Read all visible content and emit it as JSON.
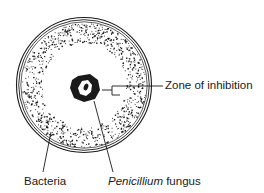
{
  "diagram": {
    "labels": {
      "zone": "Zone of inhibition",
      "bacteria": "Bacteria",
      "fungus_italic": "Penicillium",
      "fungus_rest": " fungus"
    },
    "colors": {
      "ink": "#1a1a1a",
      "background": "#ffffff"
    }
  }
}
